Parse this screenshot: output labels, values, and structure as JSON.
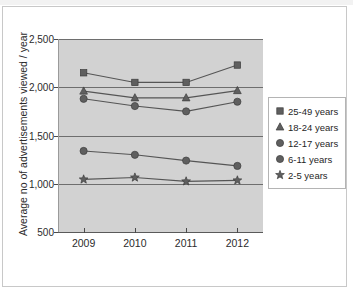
{
  "chart_data": {
    "type": "line",
    "title": "",
    "subtitle": "",
    "xlabel": "",
    "ylabel": "Average no of advertisements viewed / year",
    "categories": [
      "2009",
      "2010",
      "2011",
      "2012"
    ],
    "x": [
      2009,
      2010,
      2011,
      2012
    ],
    "ylim": [
      500,
      2500
    ],
    "yticks": [
      500,
      1000,
      1500,
      2000,
      2500
    ],
    "ytick_labels": [
      "500",
      "1,000",
      "1,500",
      "2,000",
      "2,500"
    ],
    "grid": true,
    "grid_axis": "y",
    "legend_position": "right",
    "plot_background": "#d2d2d2",
    "marker_color": "#5f5f5f",
    "line_color": "#555555",
    "series": [
      {
        "name": "25-49 years",
        "marker": "square",
        "values": [
          2150,
          2050,
          2050,
          2230
        ]
      },
      {
        "name": "18-24 years",
        "marker": "triangle",
        "values": [
          1960,
          1890,
          1890,
          1965
        ]
      },
      {
        "name": "12-17 years",
        "marker": "circle",
        "values": [
          1880,
          1805,
          1750,
          1850
        ]
      },
      {
        "name": "6-11 years",
        "marker": "circle",
        "values": [
          1340,
          1300,
          1240,
          1185
        ]
      },
      {
        "name": "2-5 years",
        "marker": "star",
        "values": [
          1045,
          1065,
          1025,
          1035
        ]
      }
    ]
  },
  "legend": {
    "items": [
      {
        "label": "25-49 years",
        "marker": "square"
      },
      {
        "label": "18-24 years",
        "marker": "triangle"
      },
      {
        "label": "12-17 years",
        "marker": "circle"
      },
      {
        "label": "6-11 years",
        "marker": "circle"
      },
      {
        "label": "2-5 years",
        "marker": "star"
      }
    ]
  }
}
